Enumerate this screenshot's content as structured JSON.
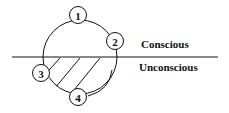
{
  "diagram": {
    "labels": {
      "conscious": "Conscious",
      "unconscious": "Unconscious"
    },
    "nodes": [
      {
        "id": "1",
        "label": "1"
      },
      {
        "id": "2",
        "label": "2"
      },
      {
        "id": "3",
        "label": "3"
      },
      {
        "id": "4",
        "label": "4"
      }
    ],
    "colors": {
      "stroke": "#111111",
      "background": "#ffffff"
    }
  }
}
